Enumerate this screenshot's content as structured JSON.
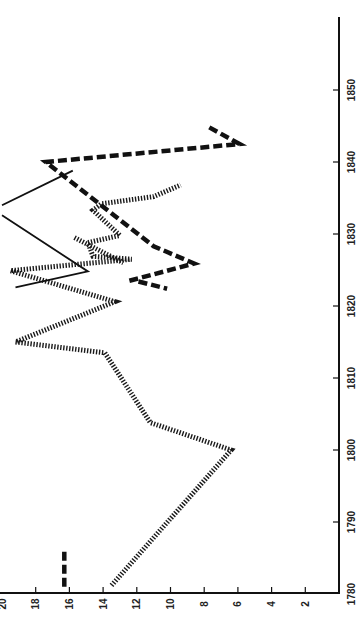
{
  "chart_data": {
    "type": "line",
    "title": "",
    "orientation": "rotated-90-ccw",
    "xlabel": "",
    "ylabel": "",
    "x_axis": {
      "min": 1780,
      "max": 1855,
      "ticks": [
        1780,
        1790,
        1800,
        1810,
        1820,
        1830,
        1840,
        1850
      ]
    },
    "y_axis": {
      "min": 0,
      "max": 20,
      "ticks": [
        2,
        4,
        6,
        8,
        10,
        12,
        14,
        16,
        18,
        20
      ]
    },
    "grid": false,
    "legend": null,
    "series": [
      {
        "name": "dotted",
        "style": "dotted",
        "points": [
          [
            1781.2,
            13.5
          ],
          [
            1800.0,
            6.4
          ],
          [
            1803.8,
            11.2
          ],
          [
            1813.5,
            13.9
          ],
          [
            1815.0,
            19.2
          ],
          [
            1820.6,
            13.3
          ],
          [
            1824.9,
            19.5
          ],
          [
            1826.5,
            12.3
          ],
          [
            1826.9,
            14.6
          ],
          [
            1828.8,
            14.9
          ],
          [
            1829.8,
            13.0
          ],
          [
            1833.3,
            14.6
          ],
          [
            1834.2,
            14.1
          ],
          [
            1835.2,
            11.0
          ],
          [
            1836.8,
            9.4
          ]
        ],
        "extra_segments": [
          [
            [
              1829.5,
              15.7
            ],
            [
              1826.0,
              12.8
            ]
          ]
        ]
      },
      {
        "name": "bold-dashed",
        "style": "dashed",
        "points": [
          [
            1844.8,
            7.7
          ],
          [
            1842.5,
            5.9
          ],
          [
            1840.0,
            17.4
          ],
          [
            1828.3,
            11.0
          ],
          [
            1825.9,
            8.6
          ],
          [
            1823.4,
            12.6
          ]
        ],
        "extra_segments": [
          [
            [
              1823.4,
              11.9
            ],
            [
              1822.4,
              10.2
            ]
          ],
          [
            [
              1781.0,
              16.3
            ],
            [
              1786.0,
              16.3
            ]
          ]
        ]
      },
      {
        "name": "solid",
        "style": "solid",
        "points": [
          [
            1838.8,
            15.8
          ],
          [
            1834.0,
            20.0
          ]
        ],
        "extra_segments": [
          [
            [
              1832.6,
              20.0
            ],
            [
              1824.8,
              14.9
            ],
            [
              1822.6,
              19.2
            ]
          ]
        ]
      }
    ]
  }
}
